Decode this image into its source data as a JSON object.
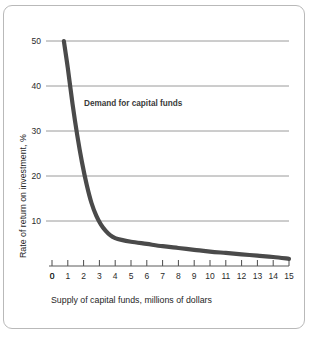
{
  "chart_data": {
    "type": "line",
    "title": "",
    "xlabel": "Supply of capital funds, millions of dollars",
    "ylabel": "Rate of return on investment, %",
    "xlim": [
      0,
      15
    ],
    "ylim": [
      0,
      50
    ],
    "grid": "horizontal",
    "legend": "none",
    "xticks": [
      "0",
      "1",
      "2",
      "3",
      "4",
      "5",
      "6",
      "7",
      "8",
      "9",
      "10",
      "11",
      "12",
      "13",
      "14",
      "15"
    ],
    "yticks": [
      "0",
      "10",
      "20",
      "30",
      "40",
      "50"
    ],
    "gridline_values": [
      10,
      20,
      30,
      40,
      50
    ],
    "series": [
      {
        "name": "Demand for capital funds",
        "color": "#4a4a4a",
        "annotation": "Demand for capital funds",
        "x": [
          0.75,
          1.0,
          1.3,
          1.6,
          1.9,
          2.2,
          2.5,
          2.8,
          3.1,
          3.4,
          3.7,
          4.0,
          4.4,
          5.0,
          6.0,
          7.0,
          8.0,
          9.0,
          10.0,
          11.0,
          12.0,
          13.0,
          14.0,
          15.0
        ],
        "y": [
          50.0,
          44.0,
          36.0,
          29.0,
          23.0,
          18.0,
          14.0,
          11.2,
          9.2,
          7.8,
          6.8,
          6.2,
          5.8,
          5.4,
          4.9,
          4.4,
          4.0,
          3.6,
          3.2,
          2.9,
          2.6,
          2.3,
          2.0,
          1.6
        ]
      }
    ]
  },
  "labels": {
    "x_axis_title": "Supply of capital funds, millions of dollars",
    "y_axis_title": "Rate of return on investment, %",
    "curve_annotation": "Demand for capital funds"
  },
  "colors": {
    "curve": "#4a4a4a",
    "gridline": "#8f8f8f",
    "axis": "#4a4a4a",
    "frame": "#b9b9b9",
    "text": "#2b2b2b"
  }
}
